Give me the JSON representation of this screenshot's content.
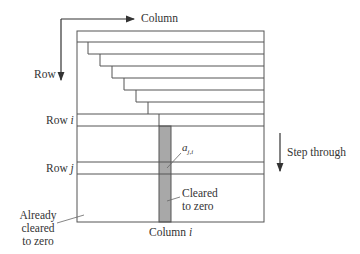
{
  "diagram": {
    "labels": {
      "column_axis": "Column",
      "row_axis": "Row",
      "row_i_prefix": "Row ",
      "row_i_var": "i",
      "row_j_prefix": "Row ",
      "row_j_var": "j",
      "element": "a",
      "element_sub": "j,i",
      "step_through": "Step through",
      "cleared_line1": "Cleared",
      "cleared_line2": "to zero",
      "already_line1": "Already",
      "already_line2": "cleared",
      "already_line3": "to zero",
      "column_i_prefix": "Column ",
      "column_i_var": "i"
    },
    "colors": {
      "line": "#555555",
      "shade": "#a8a8a8",
      "text": "#333333"
    },
    "staircase_steps": 6
  }
}
